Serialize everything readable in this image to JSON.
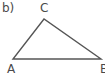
{
  "figure": {
    "part_label": "b)",
    "stroke_color": "#555555",
    "label_color": "#4a4a4a",
    "background_color": "#ffffff",
    "width": 105,
    "height": 77
  },
  "triangle": {
    "vertices": [
      {
        "name": "A",
        "label": "A",
        "x": 13,
        "y": 59
      },
      {
        "name": "B",
        "label": "B",
        "x": 101,
        "y": 59
      },
      {
        "name": "C",
        "label": "C",
        "x": 44,
        "y": 19
      }
    ],
    "points_attr": "13,59 101,59 44,19",
    "stroke_width": 1.4
  }
}
